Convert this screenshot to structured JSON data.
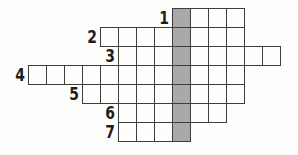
{
  "puzzle": {
    "type": "crossword-with-answer-column",
    "colors": {
      "background": "#fdfdfb",
      "grid_line": "#3d3d3d",
      "cell_background": "#fdfdfb",
      "shaded_column": "#a9a9a9",
      "number": "#1e1e1e"
    },
    "grid": {
      "origin_x": 28,
      "origin_y": 8,
      "cell_w": 18,
      "cell_h": 19,
      "cols": 14,
      "rows": 7,
      "shaded_col": 8,
      "rows_spec": [
        {
          "num": "1",
          "row": 0,
          "start_col": 8,
          "end_col": 11
        },
        {
          "num": "2",
          "row": 1,
          "start_col": 4,
          "end_col": 11
        },
        {
          "num": "3",
          "row": 2,
          "start_col": 5,
          "end_col": 13
        },
        {
          "num": "4",
          "row": 3,
          "start_col": 0,
          "end_col": 11
        },
        {
          "num": "5",
          "row": 4,
          "start_col": 3,
          "end_col": 11
        },
        {
          "num": "6",
          "row": 5,
          "start_col": 5,
          "end_col": 10
        },
        {
          "num": "7",
          "row": 6,
          "start_col": 5,
          "end_col": 8
        }
      ]
    },
    "clue_numbers": [
      "1",
      "2",
      "3",
      "4",
      "5",
      "6",
      "7"
    ]
  }
}
